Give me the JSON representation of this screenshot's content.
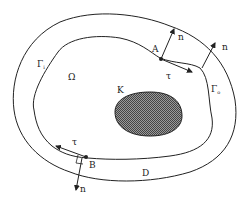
{
  "diagram": {
    "labels": {
      "omega": "Ω",
      "obstacle": "K",
      "domain": "D",
      "gamma_inner": "Γ",
      "gamma_inner_sub": "i",
      "gamma_outer": "Γ",
      "gamma_outer_sub": "o",
      "point_a": "A",
      "point_b": "B",
      "normal_a": "n",
      "normal_right": "n",
      "normal_b": "n",
      "tangent_a": "τ",
      "tangent_b": "τ"
    },
    "colors": {
      "stroke": "#222222",
      "hatch": "#555555",
      "background": "#ffffff"
    }
  }
}
